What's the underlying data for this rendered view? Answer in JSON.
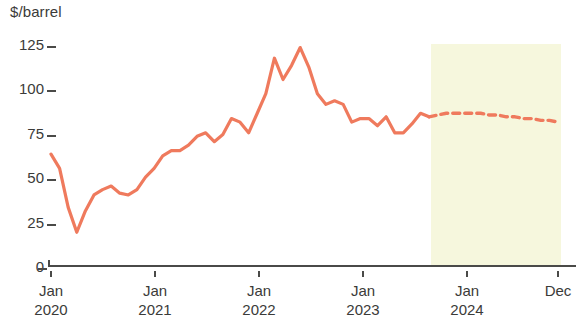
{
  "chart_data": {
    "type": "line",
    "title": "",
    "subtitle": "",
    "ylabel": "$/barrel",
    "xlabel": "",
    "ylim": [
      0,
      125
    ],
    "yticks": [
      0,
      25,
      50,
      75,
      100,
      125
    ],
    "ytick_labels": [
      "0",
      "25",
      "50",
      "75",
      "100",
      "125"
    ],
    "xtick_labels": [
      {
        "top": "Jan",
        "bottom": "2020"
      },
      {
        "top": "Jan",
        "bottom": "2021"
      },
      {
        "top": "Jan",
        "bottom": "2022"
      },
      {
        "top": "Jan",
        "bottom": "2023"
      },
      {
        "top": "Jan",
        "bottom": "2024"
      },
      {
        "top": "Dec",
        "bottom": ""
      }
    ],
    "grid": false,
    "legend": null,
    "x_range": [
      "2020-01",
      "2024-12"
    ],
    "colors": {
      "line": "#ef7a5d",
      "forecast_line": "#ef7a5d",
      "forecast_band": "#f6f7dd",
      "axis": "#4a4a48",
      "text": "#3b3b39"
    },
    "annotations": [
      {
        "type": "shaded_region",
        "label": "forecast",
        "x_start": "2023-09",
        "x_end": "2024-12"
      }
    ],
    "series": [
      {
        "name": "Crude oil price (history)",
        "style": "solid",
        "x": [
          "2020-01",
          "2020-02",
          "2020-03",
          "2020-04",
          "2020-05",
          "2020-06",
          "2020-07",
          "2020-08",
          "2020-09",
          "2020-10",
          "2020-11",
          "2020-12",
          "2021-01",
          "2021-02",
          "2021-03",
          "2021-04",
          "2021-05",
          "2021-06",
          "2021-07",
          "2021-08",
          "2021-09",
          "2021-10",
          "2021-11",
          "2021-12",
          "2022-01",
          "2022-02",
          "2022-03",
          "2022-04",
          "2022-05",
          "2022-06",
          "2022-07",
          "2022-08",
          "2022-09",
          "2022-10",
          "2022-11",
          "2022-12",
          "2023-01",
          "2023-02",
          "2023-03",
          "2023-04",
          "2023-05",
          "2023-06",
          "2023-07",
          "2023-08",
          "2023-09"
        ],
        "values": [
          63,
          55,
          33,
          19,
          31,
          40,
          43,
          45,
          41,
          40,
          43,
          50,
          55,
          62,
          65,
          65,
          68,
          73,
          75,
          70,
          74,
          83,
          81,
          75,
          86,
          97,
          117,
          105,
          113,
          123,
          112,
          97,
          91,
          93,
          91,
          81,
          83,
          83,
          79,
          84,
          75,
          75,
          80,
          86,
          84
        ]
      },
      {
        "name": "Crude oil price (forecast)",
        "style": "dashed",
        "x": [
          "2023-09",
          "2023-10",
          "2023-11",
          "2023-12",
          "2024-01",
          "2024-02",
          "2024-03",
          "2024-04",
          "2024-05",
          "2024-06",
          "2024-07",
          "2024-08",
          "2024-09",
          "2024-10",
          "2024-11",
          "2024-12"
        ],
        "values": [
          84,
          85,
          86,
          86,
          86,
          86,
          86,
          85,
          85,
          84,
          84,
          83,
          83,
          82,
          82,
          81
        ]
      }
    ]
  },
  "geometry": {
    "x_left_px": 51,
    "x_right_px": 558,
    "y_zero_px": 266,
    "y_top_px": 44,
    "months_total": 59,
    "band_start_px": 431,
    "band_end_px": 561
  }
}
